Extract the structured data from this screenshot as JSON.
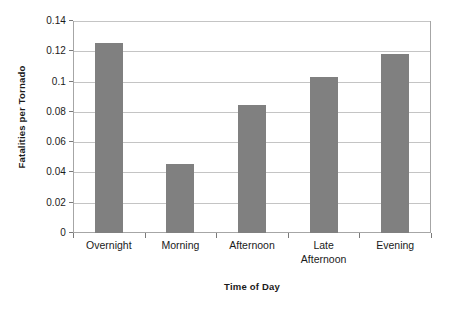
{
  "chart_data": {
    "type": "bar",
    "title": "",
    "xlabel": "Time of Day",
    "ylabel": "Fatalities per Tornado",
    "categories": [
      "Overnight",
      "Morning",
      "Afternoon",
      "Late Afternoon",
      "Evening"
    ],
    "category_lines": [
      [
        "Overnight"
      ],
      [
        "Morning"
      ],
      [
        "Afternoon"
      ],
      [
        "Late",
        "Afternoon"
      ],
      [
        "Evening"
      ]
    ],
    "values": [
      0.1255,
      0.0455,
      0.0845,
      0.103,
      0.1185
    ],
    "ylim": [
      0,
      0.14
    ],
    "yticks": [
      0,
      0.02,
      0.04,
      0.06,
      0.08,
      0.1,
      0.12,
      0.14
    ],
    "ytick_labels": [
      "0",
      "0.02",
      "0.04",
      "0.06",
      "0.08",
      "0.1",
      "0.12",
      "0.14"
    ],
    "grid": "horizontal",
    "legend": "none",
    "bar_color": "#808080",
    "gridline_color": "#c4c4c4",
    "axis_color": "#a6a6a6",
    "background_color": "#ffffff"
  }
}
